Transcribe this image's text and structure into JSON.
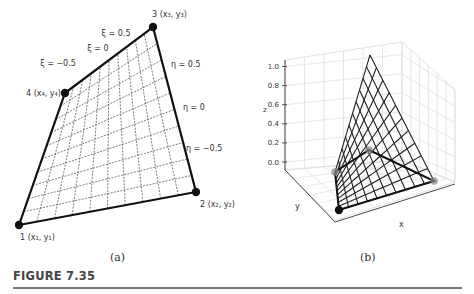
{
  "figure": {
    "title": "FIGURE 7.35",
    "subfigures": [
      {
        "id": "a",
        "label": "(a)"
      },
      {
        "id": "b",
        "label": "(b)"
      }
    ]
  },
  "panel_a": {
    "nodes": [
      {
        "id": 1,
        "label": "1 (x₁, y₁)",
        "x": 19,
        "y": 225,
        "lx": 20,
        "ly": 240
      },
      {
        "id": 2,
        "label": "2 (x₂, y₂)",
        "x": 196,
        "y": 192,
        "lx": 200,
        "ly": 207
      },
      {
        "id": 3,
        "label": "3 (x₃, y₃)",
        "x": 153,
        "y": 27,
        "lx": 152,
        "ly": 17
      },
      {
        "id": 4,
        "label": "4 (x₄, y₄)",
        "x": 65,
        "y": 93,
        "lx": 26,
        "ly": 96
      }
    ],
    "mesh_divisions": 10,
    "xi_labels": [
      {
        "text": "ξ = 0.5",
        "x": 116,
        "y": 36
      },
      {
        "text": "ξ = 0",
        "x": 98,
        "y": 51
      },
      {
        "text": "ξ = −0.5",
        "x": 58,
        "y": 66
      }
    ],
    "eta_labels": [
      {
        "text": "η = 0.5",
        "x": 171,
        "y": 67
      },
      {
        "text": "η = 0",
        "x": 183,
        "y": 110
      },
      {
        "text": "η = −0.5",
        "x": 186,
        "y": 151
      }
    ]
  },
  "panel_b": {
    "z_axis_label": "z",
    "x_axis_label": "x",
    "y_axis_label": "y",
    "z_ticks": [
      "0.0",
      "0.2",
      "0.4",
      "0.6",
      "0.8",
      "1.0"
    ],
    "apex": {
      "x": 370,
      "y": 55
    },
    "base_nodes": [
      {
        "name": "front",
        "x": 339,
        "y": 210
      },
      {
        "name": "right",
        "x": 434,
        "y": 181
      },
      {
        "name": "back",
        "x": 369,
        "y": 150
      },
      {
        "name": "left",
        "x": 335,
        "y": 172
      }
    ],
    "mesh_divisions": 10
  },
  "chart_data": {
    "type": "surface",
    "title": "",
    "xlabel": "x",
    "ylabel": "y",
    "zlabel": "z",
    "zlim": [
      0.0,
      1.0
    ],
    "z_ticks": [
      0.0,
      0.2,
      0.4,
      0.6,
      0.8,
      1.0
    ]
  }
}
